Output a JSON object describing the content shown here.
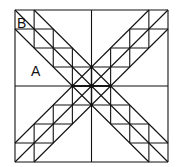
{
  "diagram": {
    "title": "",
    "labels": {
      "a": "A",
      "b": "B"
    },
    "colors": {
      "stroke": "#111111",
      "background": "#ffffff"
    },
    "grid": {
      "divisions": 8,
      "x0": 15,
      "y0": 10,
      "width": 153,
      "height": 152
    }
  }
}
